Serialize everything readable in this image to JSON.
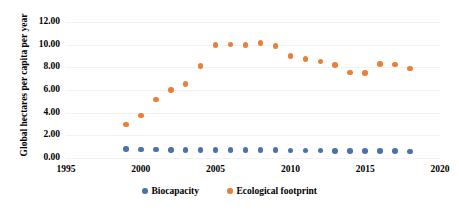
{
  "chart_data": {
    "type": "scatter",
    "title": "",
    "xlabel": "",
    "ylabel": "Global hectares per capita per year",
    "xlim": [
      1995,
      2020
    ],
    "ylim": [
      0.0,
      12.0
    ],
    "grid": true,
    "legend_position": "bottom",
    "xticks": [
      "1995",
      "2000",
      "2005",
      "2010",
      "2015",
      "2020"
    ],
    "xtick_values": [
      1995,
      2000,
      2005,
      2010,
      2015,
      2020
    ],
    "yticks": [
      "0.00",
      "2.00",
      "4.00",
      "6.00",
      "8.00",
      "10.00",
      "12.00"
    ],
    "ytick_values": [
      0,
      2,
      4,
      6,
      8,
      10,
      12
    ],
    "x": [
      1999,
      2000,
      2001,
      2002,
      2003,
      2004,
      2005,
      2006,
      2007,
      2008,
      2009,
      2010,
      2011,
      2012,
      2013,
      2014,
      2015,
      2016,
      2017,
      2018
    ],
    "series": [
      {
        "name": "Biocapacity",
        "color": "#4a72b0",
        "marker": "circle",
        "values": [
          0.8,
          0.76,
          0.74,
          0.73,
          0.72,
          0.71,
          0.7,
          0.7,
          0.69,
          0.68,
          0.68,
          0.67,
          0.66,
          0.65,
          0.64,
          0.63,
          0.62,
          0.61,
          0.6,
          0.59
        ]
      },
      {
        "name": "Ecological footprint",
        "color": "#e8803a",
        "marker": "circle",
        "values": [
          2.95,
          3.75,
          5.15,
          6.0,
          6.55,
          8.1,
          9.95,
          10.0,
          9.95,
          10.15,
          9.9,
          9.0,
          8.75,
          8.5,
          8.2,
          7.55,
          7.5,
          8.3,
          8.25,
          7.9
        ]
      }
    ]
  },
  "legend": {
    "items": [
      {
        "label": "Biocapacity",
        "color": "#4a72b0"
      },
      {
        "label": "Ecological footprint",
        "color": "#e8803a"
      }
    ]
  }
}
